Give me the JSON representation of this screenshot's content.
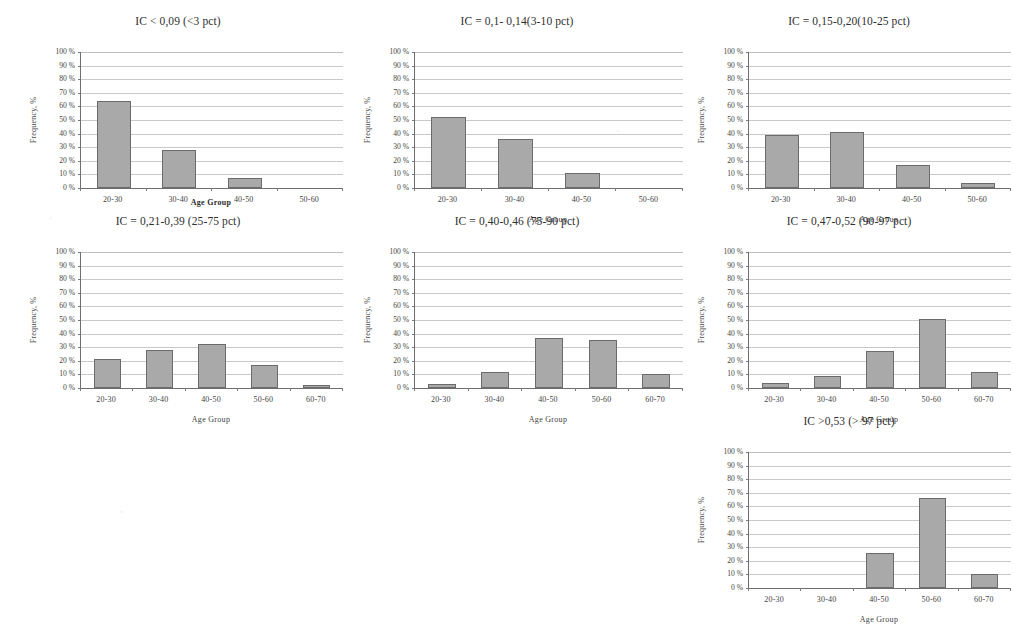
{
  "figure": {
    "axis_titles": {
      "y": "Frequency, %",
      "x": "Age Group"
    },
    "y_ticks": [
      "100 %",
      "90 %",
      "80 %",
      "70 %",
      "60 %",
      "50 %",
      "40 %",
      "30 %",
      "20 %",
      "10 %",
      "0 %"
    ],
    "bar_color": "#a9a9a9",
    "bar_border_color": "#6b6b6b",
    "grid_color": "#c9c9c9",
    "axis_color": "#6e6e6e"
  },
  "chart_data": [
    {
      "type": "bar",
      "id": "ic-lt-009",
      "title": "IC < 0,09 (<3 pct)",
      "categories": [
        "20-30",
        "30-40",
        "40-50",
        "50-60"
      ],
      "values": [
        64,
        28,
        7,
        0
      ],
      "xlabel": "Age Group",
      "ylabel": "Frequency, %",
      "ylim": [
        0,
        100
      ],
      "grid": true,
      "label_overlap": true
    },
    {
      "type": "bar",
      "id": "ic-01-014",
      "title": "IC = 0,1- 0,14(3-10 pct)",
      "categories": [
        "20-30",
        "30-40",
        "40-50",
        "50-60"
      ],
      "values": [
        52,
        36,
        11,
        0
      ],
      "xlabel": "Age Group",
      "ylabel": "Frequency, %",
      "ylim": [
        0,
        100
      ],
      "grid": true,
      "label_overlap": false
    },
    {
      "type": "bar",
      "id": "ic-015-020",
      "title": "IC = 0,15-0,20(10-25 pct)",
      "categories": [
        "20-30",
        "30-40",
        "40-50",
        "50-60"
      ],
      "values": [
        39,
        41,
        17,
        4
      ],
      "xlabel": "Age Group",
      "ylabel": "Frequency, %",
      "ylim": [
        0,
        100
      ],
      "grid": true,
      "label_overlap": false
    },
    {
      "type": "bar",
      "id": "ic-021-039",
      "title": "IC = 0,21-0,39 (25-75 pct)",
      "categories": [
        "20-30",
        "30-40",
        "40-50",
        "50-60",
        "60-70"
      ],
      "values": [
        21,
        28,
        32,
        17,
        2
      ],
      "xlabel": "Age Group",
      "ylabel": "Frequency, %",
      "ylim": [
        0,
        100
      ],
      "grid": true,
      "label_overlap": false
    },
    {
      "type": "bar",
      "id": "ic-040-046",
      "title": "IC = 0,40-0,46 (75-90 pct)",
      "categories": [
        "20-30",
        "30-40",
        "40-50",
        "50-60",
        "60-70"
      ],
      "values": [
        3,
        12,
        37,
        35,
        10
      ],
      "xlabel": "Age Group",
      "ylabel": "Frequency, %",
      "ylim": [
        0,
        100
      ],
      "grid": true,
      "label_overlap": false
    },
    {
      "type": "bar",
      "id": "ic-047-052",
      "title": "IC = 0,47-0,52 (90-97 pct)",
      "categories": [
        "20-30",
        "30-40",
        "40-50",
        "50-60",
        "60-70"
      ],
      "values": [
        4,
        9,
        27,
        51,
        12
      ],
      "xlabel": "Age Group",
      "ylabel": "Frequency, %",
      "ylim": [
        0,
        100
      ],
      "grid": true,
      "label_overlap": false
    },
    {
      "type": "bar",
      "id": "ic-gt-053",
      "title": "IC >0,53 (> 97 pct)",
      "categories": [
        "20-30",
        "30-40",
        "40-50",
        "50-60",
        "60-70"
      ],
      "values": [
        0,
        0,
        26,
        66,
        10
      ],
      "xlabel": "Age Group",
      "ylabel": "Frequency, %",
      "ylim": [
        0,
        100
      ],
      "grid": true,
      "label_overlap": false
    }
  ]
}
